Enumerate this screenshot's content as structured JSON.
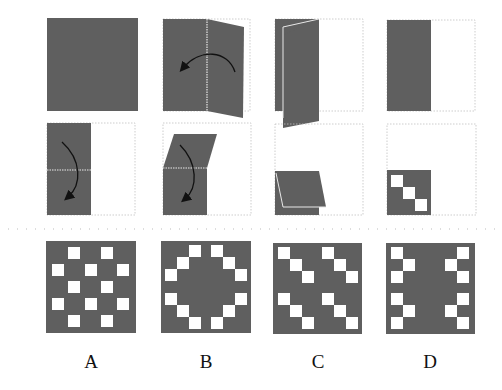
{
  "colors": {
    "paper": "#5f5f5f",
    "outline": "#b8b8b8",
    "crease": "#e8e8e8",
    "arrow": "#111111",
    "background": "#ffffff"
  },
  "fold_steps_row1": [
    {
      "id": "step1",
      "frame": [
        47,
        18,
        91,
        93
      ],
      "description": "full square paper"
    },
    {
      "id": "step2",
      "frame": [
        163,
        18,
        88,
        93
      ],
      "description": "fold right half over to left along vertical center crease",
      "arrow": "curved-left"
    },
    {
      "id": "step3",
      "frame": [
        275,
        18,
        88,
        93
      ],
      "description": "right half folding over left half"
    },
    {
      "id": "step4",
      "frame": [
        387,
        18,
        88,
        93
      ],
      "description": "folded to left half rectangle"
    }
  ],
  "fold_steps_row2": [
    {
      "id": "step5",
      "frame": [
        47,
        123,
        88,
        92
      ],
      "description": "fold top half down along horizontal crease",
      "arrow": "curved-down"
    },
    {
      "id": "step6",
      "frame": [
        163,
        123,
        88,
        92
      ],
      "description": "top half folding down",
      "arrow": "curved-down"
    },
    {
      "id": "step7",
      "frame": [
        275,
        123,
        88,
        92
      ],
      "description": "folded to bottom-left quarter"
    },
    {
      "id": "step8",
      "frame": [
        387,
        123,
        88,
        92
      ],
      "description": "quarter with three diagonal square holes punched"
    }
  ],
  "options": [
    {
      "label": "A",
      "frame": [
        46,
        241,
        90,
        92
      ],
      "holes": [
        [
          1,
          0
        ],
        [
          3,
          0
        ],
        [
          0,
          1
        ],
        [
          2,
          1
        ],
        [
          4,
          1
        ],
        [
          1,
          2
        ],
        [
          3,
          2
        ],
        [
          0,
          3
        ],
        [
          2,
          3
        ],
        [
          4,
          3
        ],
        [
          1,
          4
        ],
        [
          3,
          4
        ]
      ],
      "grid": "5x5-offset"
    },
    {
      "label": "B",
      "frame": [
        161,
        241,
        90,
        92
      ],
      "holes": "ring"
    },
    {
      "label": "C",
      "frame": [
        273,
        241,
        90,
        92
      ],
      "holes": "diagonal-pairs"
    },
    {
      "label": "D",
      "frame": [
        386,
        241,
        90,
        92
      ],
      "holes": "mirror-chevrons"
    }
  ],
  "labels": {
    "a": "A",
    "b": "B",
    "c": "C",
    "d": "D"
  }
}
